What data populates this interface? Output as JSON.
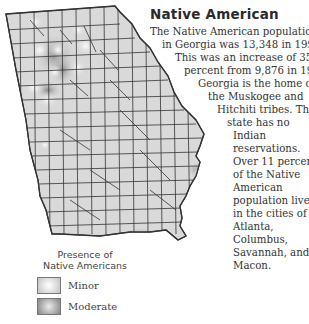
{
  "title": "Native American",
  "body_lines": [
    {
      "text": "The Native American population",
      "x": 150
    },
    {
      "text": "in Georgia was 13,348 in 1990.",
      "x": 162
    },
    {
      "text": "This was an increase of 35.16",
      "x": 175
    },
    {
      "text": "percent from 9,876 in 1980.",
      "x": 184
    },
    {
      "text": "Georgia is the home of",
      "x": 198
    },
    {
      "text": "the Muskogee and",
      "x": 208
    },
    {
      "text": "Hitchiti tribes. The",
      "x": 217
    },
    {
      "text": "state has no",
      "x": 227
    },
    {
      "text": "Indian",
      "x": 233
    },
    {
      "text": "reservations.",
      "x": 233
    },
    {
      "text": "Over 11 percent",
      "x": 233
    },
    {
      "text": "of the Native",
      "x": 233
    },
    {
      "text": "American",
      "x": 233
    },
    {
      "text": "population lives",
      "x": 233
    },
    {
      "text": "in the cities of",
      "x": 233
    },
    {
      "text": "Atlanta,",
      "x": 233
    },
    {
      "text": "Columbus,",
      "x": 233
    },
    {
      "text": "Savannah, and",
      "x": 233
    },
    {
      "text": "Macon.",
      "x": 233
    }
  ],
  "map": {
    "region": "Georgia",
    "fill_color": "#d9d9d9",
    "border_color": "#333333"
  },
  "legend": {
    "title_line1": "Presence of",
    "title_line2": "Native Americans",
    "items": [
      {
        "label": "Minor",
        "color": "#c8c8c8"
      },
      {
        "label": "Moderate",
        "color": "#8e8e8e"
      }
    ]
  }
}
